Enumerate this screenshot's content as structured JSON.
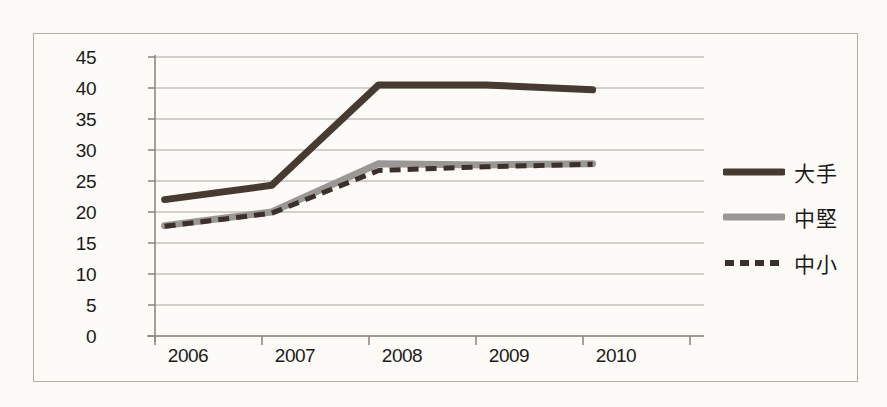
{
  "chart_data": {
    "type": "line",
    "title": "",
    "xlabel": "",
    "ylabel": "",
    "categories": [
      "2006",
      "2007",
      "2008",
      "2009",
      "2010"
    ],
    "ylim": [
      0,
      45
    ],
    "yticks": [
      0,
      5,
      10,
      15,
      20,
      25,
      30,
      35,
      40,
      45
    ],
    "grid": true,
    "legend_position": "right",
    "series": [
      {
        "name": "大手",
        "values": [
          22.0,
          24.3,
          40.5,
          40.5,
          39.7
        ],
        "color": "#463a31",
        "style": "solid",
        "width": 7
      },
      {
        "name": "中堅",
        "values": [
          17.8,
          20.0,
          27.8,
          27.6,
          27.8
        ],
        "color": "#9a9894",
        "style": "solid",
        "width": 7
      },
      {
        "name": "中小",
        "values": [
          17.7,
          19.8,
          26.7,
          27.3,
          27.7
        ],
        "color": "#3b312a",
        "style": "dashed",
        "width": 5
      }
    ]
  },
  "axis": {
    "ytick_labels": [
      "45",
      "40",
      "35",
      "30",
      "25",
      "20",
      "15",
      "10",
      "5",
      "0"
    ],
    "xtick_labels": [
      "2006",
      "2007",
      "2008",
      "2009",
      "2010"
    ]
  },
  "legend": {
    "items": [
      {
        "label": "大手",
        "color": "#463a31",
        "style": "solid"
      },
      {
        "label": "中堅",
        "color": "#9a9894",
        "style": "solid"
      },
      {
        "label": "中小",
        "color": "#3b312a",
        "style": "dashed"
      }
    ]
  },
  "colors": {
    "background": "#fbfaf7",
    "frame": "#b3b0a8",
    "grid": "#a9a69e",
    "axis": "#8d8a82",
    "text": "#1c1a18"
  }
}
